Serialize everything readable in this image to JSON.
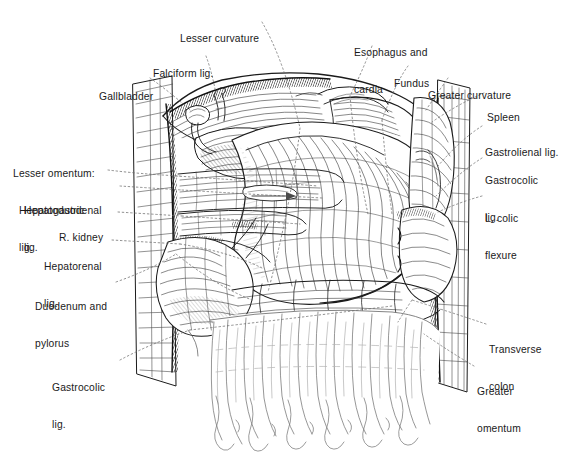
{
  "figure": {
    "background_color": "#ffffff",
    "ink_color": "#1a1a1a",
    "width": 567,
    "height": 471,
    "style": "pen-and-ink line engraving / hatched medical illustration"
  },
  "labels": [
    {
      "id": "lesser-curvature",
      "text": "Lesser curvature",
      "x": 180,
      "y": 8,
      "align": "left",
      "lines": [
        "Lesser curvature"
      ]
    },
    {
      "id": "esophagus-cardia",
      "text": "Esophagus and\ncardia",
      "x": 354,
      "y": 22,
      "align": "left",
      "lines": [
        "Esophagus and",
        "cardia"
      ]
    },
    {
      "id": "falciform-lig",
      "text": "Falciform lig.",
      "x": 153,
      "y": 43,
      "align": "left",
      "lines": [
        "Falciform lig."
      ]
    },
    {
      "id": "fundus",
      "text": "Fundus",
      "x": 394,
      "y": 53,
      "align": "left",
      "lines": [
        "Fundus"
      ]
    },
    {
      "id": "gallbladder",
      "text": "Gallbladder",
      "x": 99,
      "y": 66,
      "align": "left",
      "lines": [
        "Gallbladder"
      ]
    },
    {
      "id": "greater-curvature",
      "text": "Greater curvature",
      "x": 428,
      "y": 65,
      "align": "left",
      "lines": [
        "Greater curvature"
      ]
    },
    {
      "id": "spleen",
      "text": "Spleen",
      "x": 487,
      "y": 87,
      "align": "left",
      "lines": [
        "Spleen"
      ]
    },
    {
      "id": "gastrolienal-lig",
      "text": "Gastrolienal lig.",
      "x": 485,
      "y": 122,
      "align": "left",
      "lines": [
        "Gastrolienal lig."
      ]
    },
    {
      "id": "gastrocolic-lig-r",
      "text": "Gastrocolic\nlig.",
      "x": 485,
      "y": 150,
      "align": "left",
      "lines": [
        "Gastrocolic",
        "lig."
      ]
    },
    {
      "id": "lesser-omentum",
      "text": "Lesser omentum:\nHepatogastric\nlig.",
      "x": 13,
      "y": 143,
      "align": "left",
      "lines": [
        "Lesser omentum:",
        "  Hepatogastric",
        "  lig."
      ]
    },
    {
      "id": "hepatoduodenal-lig",
      "text": "Hepatoduodenal\nlig.",
      "x": 24,
      "y": 180,
      "align": "left",
      "lines": [
        "Hepatoduodenal",
        "lig."
      ]
    },
    {
      "id": "l-colic-flexure",
      "text": "L. colic\nflexure",
      "x": 485,
      "y": 188,
      "align": "left",
      "lines": [
        "L. colic",
        "flexure"
      ]
    },
    {
      "id": "r-kidney",
      "text": "R. kidney",
      "x": 59,
      "y": 207,
      "align": "left",
      "lines": [
        "R. kidney"
      ]
    },
    {
      "id": "hepatorenal-lig",
      "text": "Hepatorenal\nlig.",
      "x": 44,
      "y": 236,
      "align": "left",
      "lines": [
        "Hepatorenal",
        "lig."
      ]
    },
    {
      "id": "duodenum-pylorus",
      "text": "Duodenum and\npylorus",
      "x": 35,
      "y": 276,
      "align": "left",
      "lines": [
        "Duodenum and",
        "pylorus"
      ]
    },
    {
      "id": "transverse-colon",
      "text": "Transverse\ncolon",
      "x": 489,
      "y": 319,
      "align": "left",
      "lines": [
        "Transverse",
        "colon"
      ]
    },
    {
      "id": "gastrocolic-lig-l",
      "text": "Gastrocolic\nlig.",
      "x": 52,
      "y": 357,
      "align": "left",
      "lines": [
        "Gastrocolic",
        "lig."
      ]
    },
    {
      "id": "greater-omentum",
      "text": "Greater\nomentum",
      "x": 477,
      "y": 361,
      "align": "left",
      "lines": [
        "Greater",
        "omentum"
      ]
    }
  ],
  "structures": [
    "liver",
    "gallbladder",
    "falciform ligament",
    "stomach (fundus, body, lesser curvature, greater curvature)",
    "esophagus and cardia",
    "spleen",
    "gastrolienal ligament",
    "gastrocolic ligament",
    "lesser omentum (hepatogastric and hepatoduodenal ligaments)",
    "hepatorenal ligament",
    "right kidney",
    "duodenum and pylorus",
    "left colic flexure",
    "transverse colon",
    "greater omentum"
  ]
}
